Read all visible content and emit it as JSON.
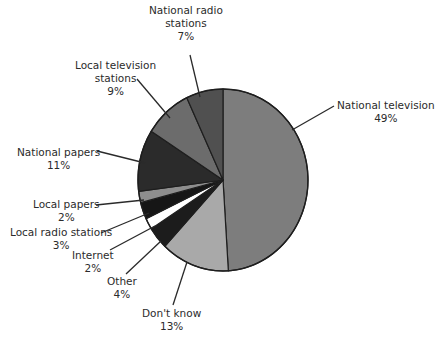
{
  "chart_data": {
    "type": "pie",
    "title": "",
    "start_angle_deg": 0,
    "direction": "clockwise",
    "categories": [
      "National television",
      "Don't know",
      "Other",
      "Internet",
      "Local radio stations",
      "Local papers",
      "National papers",
      "Local television stations",
      "National radio stations"
    ],
    "values": [
      49,
      13,
      4,
      2,
      3,
      2,
      11,
      9,
      7
    ],
    "unit": "%",
    "colors": [
      "#7d7d7d",
      "#a9a9a9",
      "#1c1c1c",
      "#ffffff",
      "#161616",
      "#8e8e8e",
      "#2b2b2b",
      "#6c6c6c",
      "#505050"
    ],
    "legend": "none (leader-line labels)"
  },
  "labels": [
    {
      "name": "National television",
      "line1": "National television",
      "line2": "",
      "pct": "49%"
    },
    {
      "name": "Don't know",
      "line1": "Don't know",
      "line2": "",
      "pct": "13%"
    },
    {
      "name": "Other",
      "line1": "Other",
      "line2": "",
      "pct": "4%"
    },
    {
      "name": "Internet",
      "line1": "Internet",
      "line2": "",
      "pct": "2%"
    },
    {
      "name": "Local radio stations",
      "line1": "Local radio stations",
      "line2": "",
      "pct": "3%"
    },
    {
      "name": "Local papers",
      "line1": "Local papers",
      "line2": "",
      "pct": "2%"
    },
    {
      "name": "National papers",
      "line1": "National papers",
      "line2": "",
      "pct": "11%"
    },
    {
      "name": "Local television stations",
      "line1": "Local television",
      "line2": "stations",
      "pct": "9%"
    },
    {
      "name": "National radio stations",
      "line1": "National radio",
      "line2": "stations",
      "pct": "7%"
    }
  ]
}
